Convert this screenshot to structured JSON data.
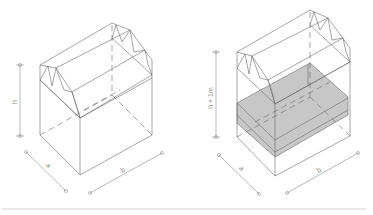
{
  "figure": {
    "left": {
      "height_label": "h",
      "depth_label": "a",
      "width_label": "b"
    },
    "right": {
      "height_label": "h + 1m",
      "depth_label": "a",
      "width_label": "b",
      "slab_color": "#b9b9b9"
    },
    "line_color": "#6a6a6a",
    "rule_color": "#cfcfcf"
  }
}
